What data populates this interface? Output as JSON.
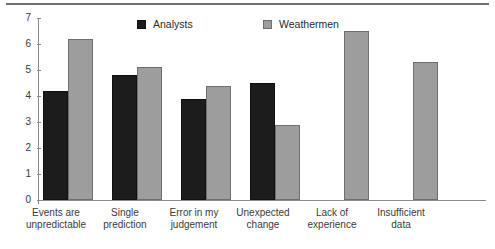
{
  "chart_data": {
    "type": "bar",
    "title": "",
    "subtitle": "",
    "xlabel": "",
    "ylabel": "",
    "ylim": [
      0,
      7
    ],
    "yticks": [
      0,
      1,
      2,
      3,
      4,
      5,
      6,
      7
    ],
    "ytick_labels": [
      "0",
      "1",
      "2",
      "3",
      "4",
      "5",
      "6",
      "7"
    ],
    "grid": false,
    "legend_position": "top-center",
    "categories": [
      "Events are\nunpredictable",
      "Single\nprediction",
      "Error in my\njudgement",
      "Unexpected\nchange",
      "Lack of\nexperience",
      "Insufficient\ndata"
    ],
    "series": [
      {
        "name": "Analysts",
        "color": "#1c1c1c",
        "values": [
          4.2,
          4.8,
          3.9,
          4.5,
          null,
          null
        ]
      },
      {
        "name": "Weathermen",
        "color": "#9d9d9d",
        "values": [
          6.2,
          5.1,
          4.4,
          2.9,
          6.5,
          5.3
        ]
      }
    ]
  },
  "legend": {
    "items": [
      {
        "label": "Analysts",
        "swatch": "dark-square-swatch"
      },
      {
        "label": "Weathermen",
        "swatch": "gray-square-swatch"
      }
    ]
  },
  "axis": {
    "y_labels": [
      "7",
      "6",
      "5",
      "4",
      "3",
      "2",
      "1",
      "0"
    ]
  }
}
